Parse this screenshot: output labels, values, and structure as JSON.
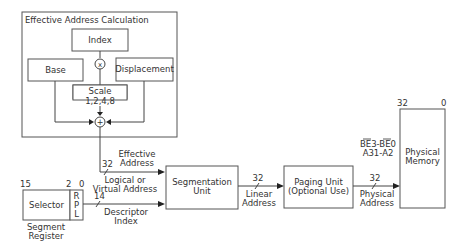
{
  "diagram": {
    "ea_calc": {
      "title": "Effective Address Calculation",
      "index": "Index",
      "base": "Base",
      "displacement": "Displacement",
      "scale_line1": "Scale",
      "scale_line2": "1,2,4,8",
      "multiply_symbol": "x",
      "add_symbol": "+"
    },
    "effective_address": {
      "line1": "Effective",
      "line2": "Address",
      "width": "32"
    },
    "logical_address": {
      "line1": "Logical or",
      "line2": "Virtual Address"
    },
    "segment_register": {
      "bit_high": "15",
      "bit_mid": "2",
      "bit_low": "0",
      "selector": "Selector",
      "rpl": [
        "R",
        "P",
        "L"
      ],
      "caption_line1": "Segment",
      "caption_line2": "Register"
    },
    "descriptor_index": {
      "width": "14",
      "line1": "Descriptor",
      "line2": "Index"
    },
    "segmentation_unit": {
      "line1": "Segmentation",
      "line2": "Unit"
    },
    "linear_address": {
      "width": "32",
      "line1": "Linear",
      "line2": "Address"
    },
    "paging_unit": {
      "line1": "Paging Unit",
      "line2": "(Optional Use)"
    },
    "physical_address": {
      "width": "32",
      "line1": "Physical",
      "line2": "Address"
    },
    "bus_signals": {
      "line1": "BE3-BE0",
      "line2": "A31-A2"
    },
    "physical_memory": {
      "bit_high": "32",
      "bit_low": "0",
      "line1": "Physical",
      "line2": "Memory"
    }
  }
}
